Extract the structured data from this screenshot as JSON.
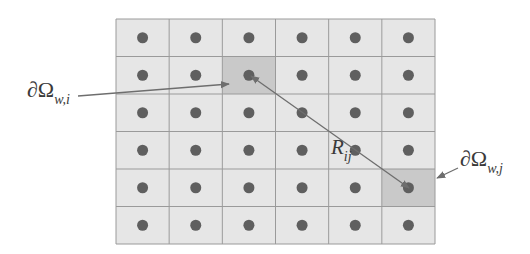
{
  "diagram": {
    "grid": {
      "rows": 6,
      "cols": 6,
      "x": 116,
      "y": 19,
      "width": 319,
      "height": 225,
      "cell_fill": "#e6e6e6",
      "line_color": "#9a9a9a",
      "dot_color": "#5f5f5f",
      "highlight_fill": "#c9c9c9",
      "highlighted_cells": [
        {
          "id": "cell-i",
          "row": 1,
          "col": 2
        },
        {
          "id": "cell-j",
          "row": 4,
          "col": 5
        }
      ]
    },
    "labels": {
      "omega_i": {
        "main": "∂Ω",
        "sub": "w,i"
      },
      "omega_j": {
        "main": "∂Ω",
        "sub": "w,j"
      },
      "distance": {
        "main": "R",
        "sub": "ij"
      }
    },
    "arrow_color": "#6e6e6e"
  }
}
